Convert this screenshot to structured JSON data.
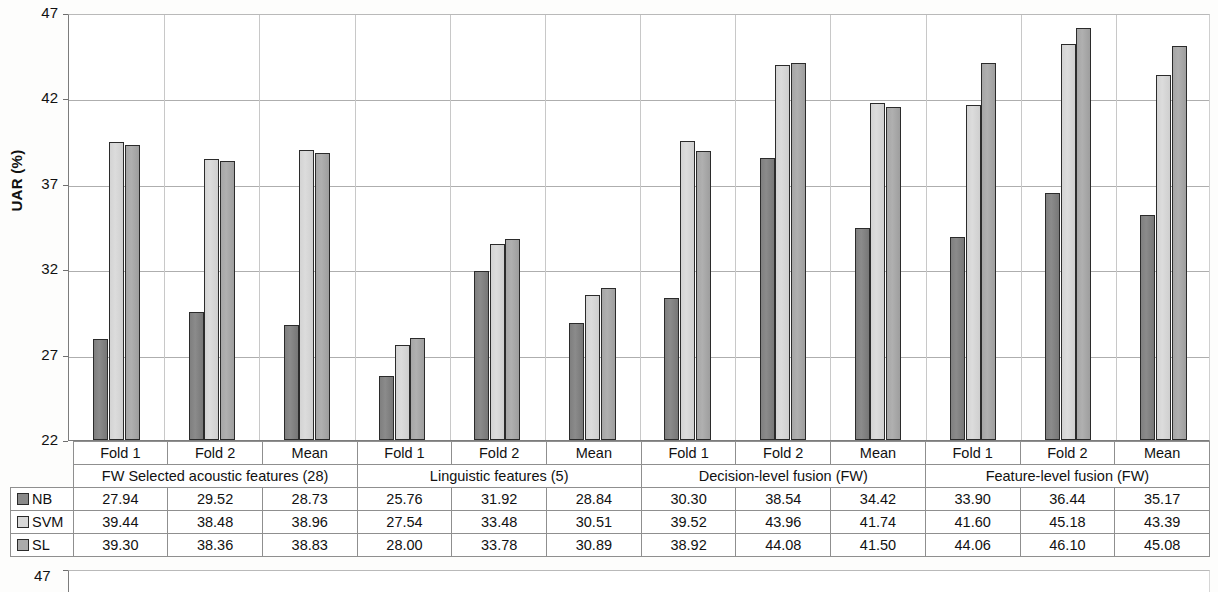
{
  "chart_data": {
    "type": "bar",
    "title": "",
    "xlabel": "",
    "ylabel": "UAR (%)",
    "ylim": [
      22,
      47
    ],
    "yticks": [
      22,
      27,
      32,
      37,
      42,
      47
    ],
    "grid": true,
    "legend_position": "table-row-headers",
    "categories": [
      "Fold 1",
      "Fold 2",
      "Mean",
      "Fold 1",
      "Fold 2",
      "Mean",
      "Fold 1",
      "Fold 2",
      "Mean",
      "Fold 1",
      "Fold 2",
      "Mean"
    ],
    "groups": [
      "FW Selected acoustic features (28)",
      "Linguistic features (5)",
      "Decision-level fusion (FW)",
      "Feature-level fusion (FW)"
    ],
    "series": [
      {
        "name": "NB",
        "color": "#8a8a8a",
        "values": [
          27.94,
          29.52,
          28.73,
          25.76,
          31.92,
          28.84,
          30.3,
          38.54,
          34.42,
          33.9,
          36.44,
          35.17
        ]
      },
      {
        "name": "SVM",
        "color": "#d8d8d8",
        "values": [
          39.44,
          38.48,
          38.96,
          27.54,
          33.48,
          30.51,
          39.52,
          43.96,
          41.74,
          41.6,
          45.18,
          43.39
        ]
      },
      {
        "name": "SL",
        "color": "#ababab",
        "values": [
          39.3,
          38.36,
          38.83,
          28.0,
          33.78,
          30.89,
          38.92,
          44.08,
          41.5,
          44.06,
          46.1,
          45.08
        ]
      }
    ]
  },
  "axis": {
    "y_title": "UAR (%)",
    "ticks": [
      "47",
      "42",
      "37",
      "32",
      "27",
      "22"
    ]
  },
  "table": {
    "fold_row": [
      "Fold 1",
      "Fold 2",
      "Mean",
      "Fold 1",
      "Fold 2",
      "Mean",
      "Fold 1",
      "Fold 2",
      "Mean",
      "Fold 1",
      "Fold 2",
      "Mean"
    ],
    "group_row": [
      "FW Selected acoustic features (28)",
      "Linguistic features (5)",
      "Decision-level fusion (FW)",
      "Feature-level fusion (FW)"
    ],
    "rows": [
      {
        "label": "NB",
        "swatch": "nb",
        "values": [
          "27.94",
          "29.52",
          "28.73",
          "25.76",
          "31.92",
          "28.84",
          "30.30",
          "38.54",
          "34.42",
          "33.90",
          "36.44",
          "35.17"
        ]
      },
      {
        "label": "SVM",
        "swatch": "svm",
        "values": [
          "39.44",
          "38.48",
          "38.96",
          "27.54",
          "33.48",
          "30.51",
          "39.52",
          "43.96",
          "41.74",
          "41.60",
          "45.18",
          "43.39"
        ]
      },
      {
        "label": "SL",
        "swatch": "sl",
        "values": [
          "39.30",
          "38.36",
          "38.83",
          "28.00",
          "33.78",
          "30.89",
          "38.92",
          "44.08",
          "41.50",
          "44.06",
          "46.10",
          "45.08"
        ]
      }
    ]
  },
  "bottom_chart": {
    "top_tick_label": "47"
  }
}
